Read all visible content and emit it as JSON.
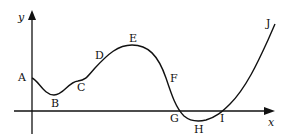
{
  "axes": {
    "x_label": "x",
    "y_label": "y"
  },
  "points": [
    {
      "label": "A",
      "x": 18,
      "y": 72
    },
    {
      "label": "B",
      "x": 51,
      "y": 98
    },
    {
      "label": "C",
      "x": 77,
      "y": 82
    },
    {
      "label": "D",
      "x": 95,
      "y": 50
    },
    {
      "label": "E",
      "x": 129,
      "y": 33
    },
    {
      "label": "F",
      "x": 170,
      "y": 73
    },
    {
      "label": "G",
      "x": 170,
      "y": 113
    },
    {
      "label": "H",
      "x": 194,
      "y": 124
    },
    {
      "label": "I",
      "x": 220,
      "y": 113
    },
    {
      "label": "J",
      "x": 266,
      "y": 18
    }
  ]
}
